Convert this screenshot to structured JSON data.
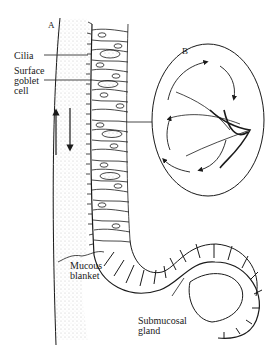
{
  "diagram": {
    "panels": [
      {
        "id": "A",
        "label": "A"
      },
      {
        "id": "B",
        "label": "B"
      }
    ],
    "labels": {
      "cilia": "Cilia",
      "surface_goblet_cell": "Surface\ngoblet\ncell",
      "mucous_blanket": "Mucous\nblanket",
      "submucosal_gland": "Submucosal\ngland"
    },
    "colors": {
      "ink": "#1a1a1a",
      "background": "#ffffff",
      "stipple": "#888888"
    }
  }
}
